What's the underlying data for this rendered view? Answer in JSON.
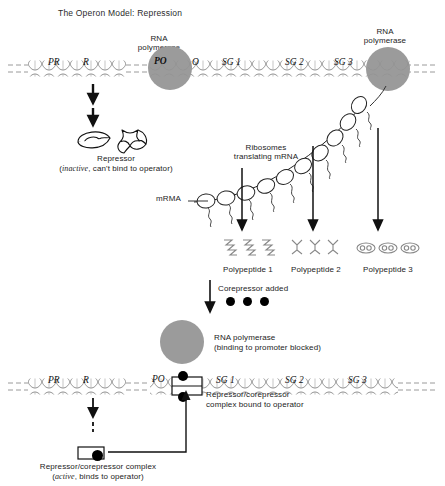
{
  "title": "The Operon Model: Repression",
  "top_section": {
    "rna_polymerase_left_label_line1": "RNA",
    "rna_polymerase_left_label_line2": "polymerase",
    "rna_polymerase_right_label_line1": "RNA",
    "rna_polymerase_right_label_line2": "polymerase",
    "gene_labels": [
      "PR",
      "R",
      "PO",
      "O",
      "SG 1",
      "SG 2",
      "SG 3"
    ],
    "promoter_regulator": "PR",
    "regulator_gene": "R",
    "promoter_operon": "PO",
    "operator": "O",
    "structural_gene_1": "SG 1",
    "structural_gene_2": "SG 2",
    "structural_gene_3": "SG 3"
  },
  "repressor": {
    "label": "Repressor",
    "state_word": "inactive",
    "state_rest": ", can't bind to operator)",
    "state_open": "("
  },
  "translation": {
    "ribosomes_line1": "Ribosomes",
    "ribosomes_line2": "translating mRNA",
    "mrna_label": "mRMA"
  },
  "polypeptides": [
    "Polypeptide 1",
    "Polypeptide 2",
    "Polypeptide 3"
  ],
  "corepressor": {
    "label": "Corepressor added",
    "dot_count": 3
  },
  "bottom_section": {
    "rna_polymerase_line1": "RNA polymerase",
    "rna_polymerase_line2": "(binding to promoter blocked)",
    "gene_labels": [
      "PR",
      "R",
      "PO",
      "SG 1",
      "SG 2",
      "SG 3"
    ],
    "bound_complex_line1": "Repressor/corepressor",
    "bound_complex_line2": "complex bound to operator",
    "complex_label": "Repressor/corepressor complex",
    "complex_state_open": "(",
    "complex_state_word": "active",
    "complex_state_rest": ", binds to operator)"
  },
  "colors": {
    "polymerase_gray": "#9b9b9b",
    "dna_line": "#8a8a8a",
    "ink": "#1a1a1a",
    "dot": "#000000"
  }
}
